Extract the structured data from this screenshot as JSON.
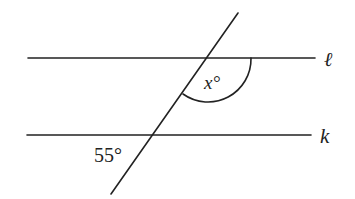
{
  "diagram": {
    "type": "parallel-lines-transversal",
    "lines": {
      "l": {
        "label": "ℓ",
        "y": 58,
        "x1": 28,
        "x2": 315
      },
      "k": {
        "label": "k",
        "y": 135,
        "x1": 27,
        "x2": 311
      }
    },
    "transversal": {
      "x1": 238,
      "y1": 13,
      "x2": 111,
      "y2": 194
    },
    "angles": {
      "x": {
        "label": "x°",
        "variable": "x",
        "unit": "°"
      },
      "given": {
        "label": "55°",
        "value": 55,
        "unit": "°"
      }
    },
    "colors": {
      "stroke": "#222222",
      "background": "#ffffff"
    }
  }
}
